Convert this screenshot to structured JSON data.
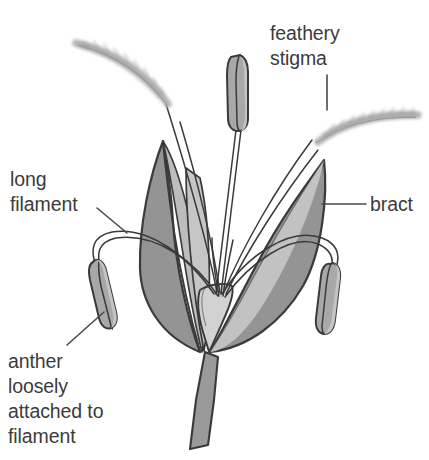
{
  "figure": {
    "background_color": "#ffffff",
    "width": 429,
    "height": 460
  },
  "labels": {
    "feathery_stigma": "feathery\nstigma",
    "long_filament": "long\nfilament",
    "bract": "bract",
    "anther": "anther\nloosely\nattached to\nfilament"
  },
  "colors": {
    "text": "#3b3b3b",
    "outline": "#3a3a3a",
    "bract_dark": "#949494",
    "bract_light": "#c2c2c2",
    "anther_fill": "#a8a8a8",
    "anther_light": "#c4c4c4",
    "stem_fill": "#9a9a9a",
    "ovary_fill": "#d2d2d2",
    "stigma_plume": "#b5b5b5",
    "leader_line": "#4a4a4a"
  },
  "parts": [
    {
      "name": "left-bract",
      "kind": "bract"
    },
    {
      "name": "right-bract",
      "kind": "bract"
    },
    {
      "name": "center-anther",
      "kind": "anther"
    },
    {
      "name": "left-anther",
      "kind": "anther"
    },
    {
      "name": "right-anther",
      "kind": "anther"
    },
    {
      "name": "left-stigma",
      "kind": "stigma"
    },
    {
      "name": "right-stigma",
      "kind": "stigma"
    },
    {
      "name": "stem",
      "kind": "stem"
    },
    {
      "name": "ovary",
      "kind": "ovary"
    }
  ]
}
